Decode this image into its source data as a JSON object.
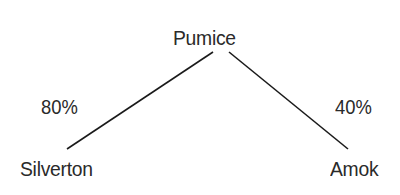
{
  "diagram": {
    "type": "tree",
    "root": {
      "label": "Pumice"
    },
    "children": [
      {
        "label": "Silverton",
        "edge_label": "80%"
      },
      {
        "label": "Amok",
        "edge_label": "40%"
      }
    ],
    "colors": {
      "text": "#2a2a2a",
      "line": "#1a1a1a",
      "background": "#ffffff"
    }
  }
}
